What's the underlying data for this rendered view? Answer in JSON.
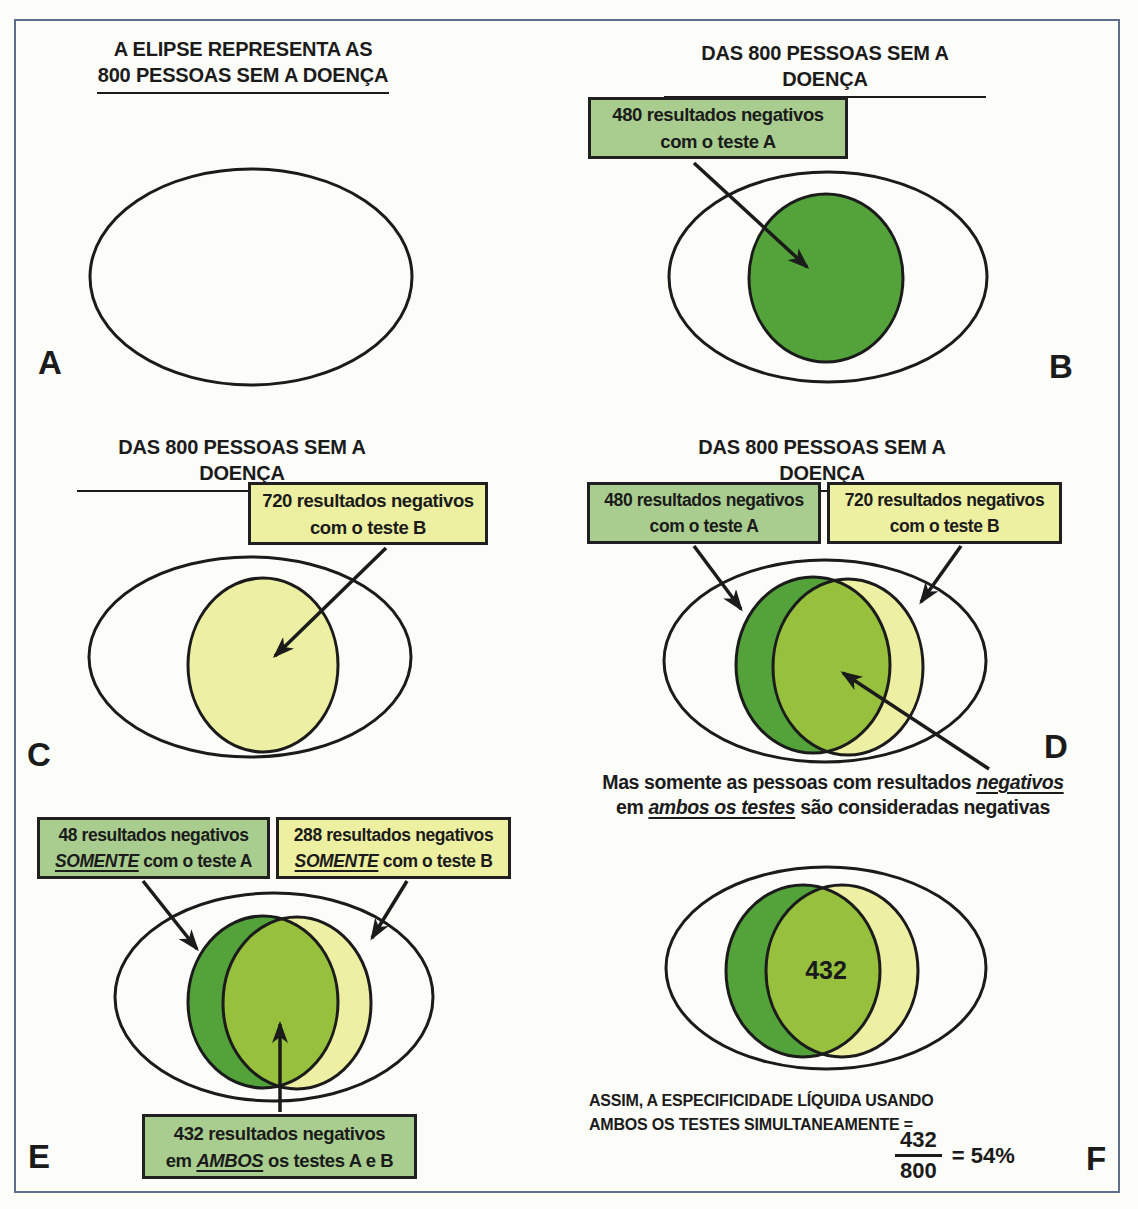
{
  "colors": {
    "test_a_green": "#53a23a",
    "test_b_yellow": "#edefa2",
    "overlap_green": "#97c13d",
    "box_green": "#a9cd8e",
    "box_yellow": "#eef0a1",
    "ink": "#1b1b1b",
    "frame_blue": "#5e6e8c"
  },
  "panels": {
    "A": {
      "letter": "A",
      "title_line1": "A ELIPSE REPRESENTA AS",
      "title_line2": "800 PESSOAS SEM A DOENÇA"
    },
    "B": {
      "letter": "B",
      "title": "DAS 800 PESSOAS SEM A DOENÇA",
      "box": {
        "line1": "480 resultados negativos",
        "line2": "com o teste A"
      }
    },
    "C": {
      "letter": "C",
      "title": "DAS 800 PESSOAS SEM A DOENÇA",
      "box": {
        "line1": "720 resultados negativos",
        "line2": "com o teste B"
      }
    },
    "D": {
      "letter": "D",
      "title": "DAS 800 PESSOAS SEM A DOENÇA",
      "box_a": {
        "line1": "480 resultados negativos",
        "line2": "com o teste A"
      },
      "box_b": {
        "line1": "720 resultados negativos",
        "line2": "com o teste B"
      },
      "caption": {
        "l1_plain": "Mas somente as pessoas com resultados ",
        "l1_em": "negativos",
        "l2_a": "em ",
        "l2_em": "ambos os testes",
        "l2_b": " são consideradas negativas"
      }
    },
    "E": {
      "letter": "E",
      "box_a": {
        "line1": "48 resultados negativos",
        "line2_em": "SOMENTE",
        "line2_rest": " com o teste A"
      },
      "box_b": {
        "line1": "288 resultados negativos",
        "line2_em": "SOMENTE",
        "line2_rest": " com o teste B"
      },
      "box_both": {
        "line1": "432 resultados negativos",
        "line2_a": "em ",
        "line2_em": "AMBOS",
        "line2_b": " os testes A e B"
      }
    },
    "F": {
      "letter": "F",
      "overlap_value": "432",
      "note_line1": "ASSIM, A ESPECIFICIDADE LÍQUIDA USANDO",
      "note_line2": "AMBOS OS TESTES SIMULTANEAMENTE =",
      "fraction": {
        "numerator": "432",
        "denominator": "800",
        "result": "= 54%"
      }
    }
  }
}
